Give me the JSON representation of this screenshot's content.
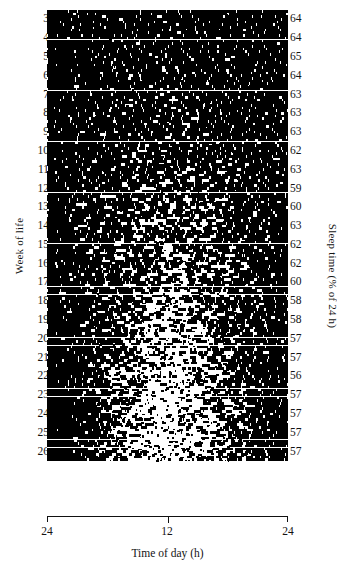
{
  "figure": {
    "type": "actogram",
    "title": "",
    "axes": {
      "x": {
        "label": "Time of day (h)",
        "ticks": [
          "24",
          "12",
          "24"
        ],
        "range_hours": [
          24,
          48
        ],
        "description": "double-plotted day starting and ending at 24:00 (midnight)"
      },
      "y_left": {
        "label": "Week of life",
        "ticks": [
          "3",
          "4",
          "5",
          "6",
          "7",
          "8",
          "9",
          "10",
          "11",
          "12",
          "13",
          "14",
          "15",
          "16",
          "17",
          "18",
          "19",
          "20",
          "21",
          "22",
          "23",
          "24",
          "25",
          "26"
        ],
        "range": [
          3,
          26
        ]
      },
      "y_right": {
        "label": "Sleep time (% of 24 h)",
        "ticks": [
          "64",
          "64",
          "65",
          "64",
          "63",
          "63",
          "63",
          "62",
          "63",
          "59",
          "60",
          "63",
          "62",
          "62",
          "60",
          "58",
          "58",
          "57",
          "57",
          "56",
          "57",
          "57",
          "57",
          "57"
        ]
      }
    }
  },
  "chart_data": {
    "type": "heatmap",
    "title": "",
    "subtitle": "",
    "xlabel": "Time of day (h)",
    "ylabel": "Week of life",
    "ylabel_right": "Sleep time (% of 24 h)",
    "xlim": [
      0,
      24
    ],
    "xticklabels": [
      "24",
      "12",
      "24"
    ],
    "xtickvalues": [
      0,
      12,
      24
    ],
    "grid": false,
    "legend": null,
    "categories": [
      "3",
      "4",
      "5",
      "6",
      "7",
      "8",
      "9",
      "10",
      "11",
      "12",
      "13",
      "14",
      "15",
      "16",
      "17",
      "18",
      "19",
      "20",
      "21",
      "22",
      "23",
      "24",
      "25",
      "26"
    ],
    "series": [
      {
        "name": "Sleep time (% of 24 h)",
        "values": [
          64,
          64,
          65,
          64,
          63,
          63,
          63,
          62,
          63,
          59,
          60,
          63,
          62,
          62,
          60,
          58,
          58,
          57,
          57,
          56,
          57,
          57,
          57,
          57
        ]
      }
    ],
    "weeks": [
      {
        "week": 3,
        "sleep_percent": 64,
        "consolidation": 0.06
      },
      {
        "week": 4,
        "sleep_percent": 64,
        "consolidation": 0.09
      },
      {
        "week": 5,
        "sleep_percent": 65,
        "consolidation": 0.12
      },
      {
        "week": 6,
        "sleep_percent": 64,
        "consolidation": 0.15
      },
      {
        "week": 7,
        "sleep_percent": 63,
        "consolidation": 0.19
      },
      {
        "week": 8,
        "sleep_percent": 63,
        "consolidation": 0.23
      },
      {
        "week": 9,
        "sleep_percent": 63,
        "consolidation": 0.27
      },
      {
        "week": 10,
        "sleep_percent": 62,
        "consolidation": 0.31
      },
      {
        "week": 11,
        "sleep_percent": 63,
        "consolidation": 0.35
      },
      {
        "week": 12,
        "sleep_percent": 59,
        "consolidation": 0.4
      },
      {
        "week": 13,
        "sleep_percent": 60,
        "consolidation": 0.44
      },
      {
        "week": 14,
        "sleep_percent": 63,
        "consolidation": 0.48
      },
      {
        "week": 15,
        "sleep_percent": 62,
        "consolidation": 0.52
      },
      {
        "week": 16,
        "sleep_percent": 62,
        "consolidation": 0.56
      },
      {
        "week": 17,
        "sleep_percent": 60,
        "consolidation": 0.61
      },
      {
        "week": 18,
        "sleep_percent": 58,
        "consolidation": 0.66
      },
      {
        "week": 19,
        "sleep_percent": 58,
        "consolidation": 0.71
      },
      {
        "week": 20,
        "sleep_percent": 57,
        "consolidation": 0.76
      },
      {
        "week": 21,
        "sleep_percent": 57,
        "consolidation": 0.8
      },
      {
        "week": 22,
        "sleep_percent": 56,
        "consolidation": 0.84
      },
      {
        "week": 23,
        "sleep_percent": 57,
        "consolidation": 0.88
      },
      {
        "week": 24,
        "sleep_percent": 57,
        "consolidation": 0.92
      },
      {
        "week": 25,
        "sleep_percent": 57,
        "consolidation": 0.95
      },
      {
        "week": 26,
        "sleep_percent": 57,
        "consolidation": 0.98
      }
    ],
    "rows_per_week": 7,
    "total_rows": 187,
    "mark_color": "#000000",
    "background_color": "#ffffff"
  }
}
